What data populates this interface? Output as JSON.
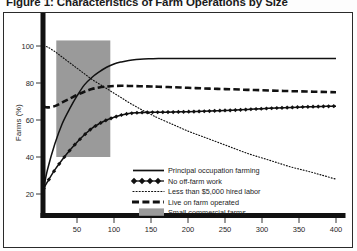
{
  "figure": {
    "caption": "Figure 1: Characteristics of Farm Operations by Size"
  },
  "chart_data": {
    "type": "line",
    "title": "Figure 1: Characteristics of Farm Operations by Size",
    "xlabel": "",
    "ylabel": "Farms (%)",
    "xlim": [
      0,
      410
    ],
    "ylim": [
      10,
      108
    ],
    "grid": false,
    "legend_position": "inside-bottom-center",
    "xticks": [
      50,
      100,
      150,
      200,
      250,
      300,
      350,
      400
    ],
    "yticks": [
      20,
      40,
      60,
      80,
      100
    ],
    "xtick_labels": [
      "50",
      "100",
      "150",
      "200",
      "250",
      "300",
      "350",
      "400"
    ],
    "ytick_labels": [
      "20",
      "40",
      "60",
      "80",
      "100"
    ],
    "x": [
      5,
      10,
      20,
      30,
      40,
      50,
      60,
      70,
      80,
      90,
      100,
      110,
      120,
      130,
      140,
      150,
      160,
      180,
      200,
      220,
      240,
      260,
      280,
      300,
      320,
      340,
      360,
      380,
      400
    ],
    "series": [
      {
        "name": "Principal occupation farming",
        "style": "solid",
        "color": "#111111",
        "values": [
          23,
          33,
          47,
          58,
          66,
          73,
          79,
          83,
          86,
          88.5,
          90.3,
          91.4,
          92.2,
          92.7,
          93,
          93.1,
          93.2,
          93.2,
          93.2,
          93.2,
          93.2,
          93.2,
          93.2,
          93.2,
          93.2,
          93.2,
          93.2,
          93.2,
          93.2
        ]
      },
      {
        "name": "No off-farm work",
        "style": "diamond-marker",
        "color": "#111111",
        "values": [
          23,
          26.5,
          33,
          38.5,
          43.5,
          48,
          52,
          55.5,
          58,
          60,
          61.5,
          62.7,
          63.5,
          63.9,
          64.1,
          64.2,
          64.2,
          64.3,
          64.5,
          64.7,
          65,
          65.3,
          65.7,
          66.1,
          66.5,
          66.8,
          67.1,
          67.3,
          67.5
        ]
      },
      {
        "name": "Less than $5,000 hired labor",
        "style": "dotted",
        "color": "#111111",
        "values": [
          100,
          99.5,
          97,
          94,
          91,
          88,
          85,
          82,
          79.5,
          77,
          74.5,
          72,
          69.5,
          67.2,
          65,
          63,
          61,
          57.5,
          54,
          51,
          48,
          45,
          42,
          39.5,
          37,
          34.5,
          32.5,
          30.3,
          28
        ]
      },
      {
        "name": "Live on farm operated",
        "style": "dashed",
        "color": "#111111",
        "values": [
          67.3,
          66.8,
          67.5,
          69.5,
          71.5,
          73.5,
          75.3,
          76.7,
          77.6,
          78.1,
          78.4,
          78.5,
          78.4,
          78.3,
          78.2,
          78.1,
          78,
          77.7,
          77.4,
          77.1,
          76.8,
          76.6,
          76.3,
          76.1,
          75.8,
          75.6,
          75.4,
          75.2,
          75
        ]
      }
    ],
    "shaded_band": {
      "name": "Small commercial farms",
      "color": "#9a9a9a",
      "x_start": 22,
      "x_end": 95,
      "y_start": 40,
      "y_end": 103
    }
  },
  "legend": {
    "items": [
      {
        "label": "Principal occupation farming",
        "marker": "solid-line"
      },
      {
        "label": "No off-farm work",
        "marker": "diamond-line"
      },
      {
        "label": "Less than $5,000 hired labor",
        "marker": "dotted-line"
      },
      {
        "label": "Live on farm operated",
        "marker": "dashed-line"
      },
      {
        "label": "Small commercial farms",
        "marker": "gray-swatch"
      }
    ]
  }
}
